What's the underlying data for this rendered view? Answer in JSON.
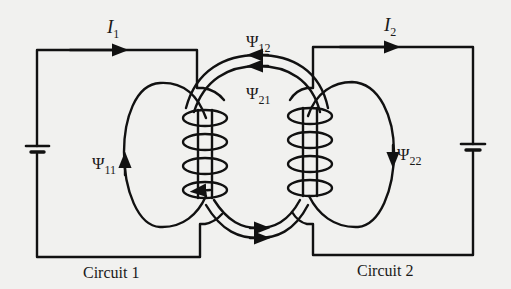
{
  "figure": {
    "type": "magnetically coupled circuits",
    "background_color": "#f1f1ef",
    "ink_color": "#111111"
  },
  "circuit1": {
    "caption": "Circuit 1",
    "current": {
      "symbol": "I",
      "subscript": "1",
      "direction": "right"
    },
    "self_flux": {
      "symbol": "Ψ",
      "subscript": "11",
      "arrow": "up"
    },
    "source": "battery"
  },
  "circuit2": {
    "caption": "Circuit 2",
    "current": {
      "symbol": "I",
      "subscript": "2",
      "direction": "right"
    },
    "self_flux": {
      "symbol": "Ψ",
      "subscript": "22",
      "arrow": "down"
    },
    "source": "battery"
  },
  "mutual_flux": {
    "psi12": {
      "symbol": "Ψ",
      "subscript": "12"
    },
    "psi21": {
      "symbol": "Ψ",
      "subscript": "21"
    }
  }
}
